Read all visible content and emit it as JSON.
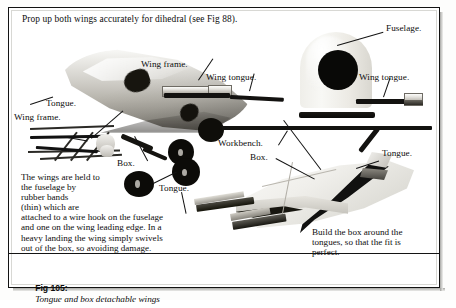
{
  "figure": {
    "headline": "Prop up both wings accurately for dihedral (see Fig 88).",
    "caption_label": "Fig 105",
    "caption_sep": ":",
    "caption_title": "Tongue and box detachable wings"
  },
  "callouts": {
    "wing_frame_top": "Wing frame.",
    "wing_tongue_mid": "Wing tongue.",
    "fuselage": "Fuselage.",
    "wing_tongue_right": "Wing tongue.",
    "tongue_left": "Tongue.",
    "wing_frame_left": "Wing frame.",
    "box_left": "Box.",
    "tongue_center": "Tongue.",
    "workbench": "Workbench.",
    "box_right": "Box.",
    "tongue_right": "Tongue."
  },
  "notes": {
    "wing_attachment": "The wings are held to\nthe fuselage by\nrubber bands\n(thin) which are\nattached to a wire hook on the fuselage\nand one on the wing leading edge. In a\nheavy landing the wing simply swivels\nout of the box, so avoiding damage.",
    "build_box": "Build the box around the\ntongues, so that the fit is\nperfect."
  },
  "colors": {
    "ink": "#0d0d0d",
    "frame": "#121212",
    "paper": "#ffffff",
    "metal_light": "#f2f1ee",
    "metal_dark": "#131210"
  }
}
